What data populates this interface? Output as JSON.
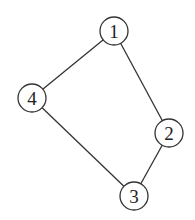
{
  "graph": {
    "type": "undirected",
    "nodes": [
      {
        "id": "1",
        "label": "1",
        "x": 114,
        "y": 31
      },
      {
        "id": "2",
        "label": "2",
        "x": 169,
        "y": 133
      },
      {
        "id": "3",
        "label": "3",
        "x": 134,
        "y": 196
      },
      {
        "id": "4",
        "label": "4",
        "x": 32,
        "y": 98
      }
    ],
    "edges": [
      {
        "from": "1",
        "to": "4"
      },
      {
        "from": "1",
        "to": "2"
      },
      {
        "from": "2",
        "to": "3"
      },
      {
        "from": "4",
        "to": "3"
      }
    ],
    "node_radius": 14,
    "colors": {
      "stroke": "#333333",
      "fill": "#ffffff",
      "text": "#222222"
    }
  }
}
